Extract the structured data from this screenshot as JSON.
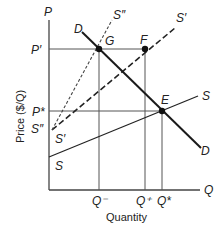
{
  "diagram": {
    "type": "supply-demand",
    "axes": {
      "y_axis_label": "P",
      "x_axis_label": "Q",
      "y_title": "Price ($/Q)",
      "x_title": "Quantity"
    },
    "price_labels": {
      "p_prime": "P′",
      "p_star": "P*"
    },
    "quantity_labels": {
      "q_minus": "Q⁻",
      "q_plus": "Q⁺",
      "q_star": "Q*"
    },
    "curves": {
      "demand_top": "D",
      "demand_bottom": "D",
      "supply_right": "S",
      "supply_left": "S",
      "s_prime_top": "S′",
      "s_prime_left": "S′",
      "s_double_prime_top": "S″",
      "s_double_prime_left": "S″"
    },
    "points": {
      "g": "G",
      "f": "F",
      "e": "E"
    },
    "colors": {
      "line": "#1a1a1a",
      "grid": "#555555",
      "background": "#ffffff"
    }
  }
}
